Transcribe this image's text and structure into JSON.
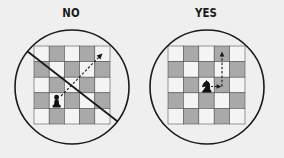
{
  "colors": {
    "background": "#efefef",
    "light_square": "#f4f4f4",
    "dark_square": "#a9a9a9",
    "outline": "#1a1a1a",
    "piece": "#111111"
  },
  "panels": [
    {
      "label": "NO",
      "verdict": "prohibited",
      "piece": "pawn-icon",
      "board": {
        "rows": 5,
        "cols": 5
      },
      "piece_position": {
        "row": 3,
        "col": 1
      },
      "move_arrow": "diagonal dashed arrow from piece toward top-right corner",
      "crossed_out": true
    },
    {
      "label": "YES",
      "verdict": "allowed",
      "piece": "knight-icon",
      "board": {
        "rows": 5,
        "cols": 5
      },
      "piece_position": {
        "row": 2,
        "col": 2
      },
      "move_arrow": "L-shaped dashed arrow: one square right, then two squares up",
      "crossed_out": false
    }
  ]
}
